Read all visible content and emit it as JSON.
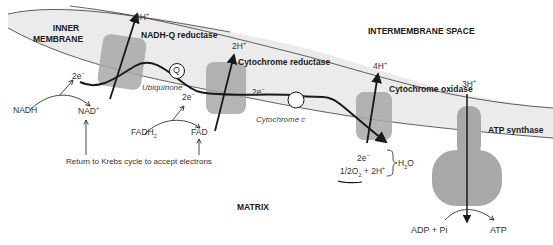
{
  "diagram": {
    "regions": {
      "inner_membrane_line1": "INNER",
      "inner_membrane_line2": "MEMBRANE",
      "intermembrane_space": "INTERMEMBRANE SPACE",
      "matrix": "MATRIX"
    },
    "complexes": {
      "nadh_q_reductase": "NADH-Q reductase",
      "cytochrome_reductase": "Cytochrome reductase",
      "cytochrome_oxidase": "Cytochrome oxidase",
      "atp_synthase": "ATP synthase"
    },
    "carriers": {
      "q_symbol": "Q",
      "ubiquinone": "Ubiquinone",
      "cytochrome_c": "Cytochrome c"
    },
    "protons": {
      "complex1": "4H",
      "complex3": "2H",
      "complex4": "4H",
      "atp_synthase": "3H",
      "charge": "+"
    },
    "electrons": {
      "label": "2e",
      "charge": "−"
    },
    "substrates": {
      "nadh": "NADH",
      "nad_plus": "NAD",
      "nad_charge": "+",
      "fadh2": "FADH",
      "fadh2_sub": "2",
      "fad": "FAD",
      "krebs_note": "Return to Krebs cycle to accept electrons",
      "oxygen_half": "1/2O",
      "oxygen_sub": "2",
      "oxygen_plus": " + 2H",
      "water": "H",
      "water_sub": "2",
      "water_o": "O",
      "adp_pi": "ADP + Pi",
      "atp": "ATP"
    },
    "colors": {
      "membrane_fill": "#ebebeb",
      "membrane_edge": "#3a3a3a",
      "protein_fill": "#a8a8a8",
      "line": "#1a1a1a"
    }
  }
}
